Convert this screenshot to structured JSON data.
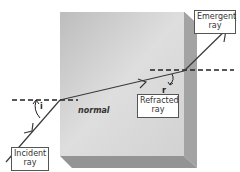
{
  "diagram": {
    "labels": {
      "incident": [
        "Incident",
        "ray"
      ],
      "refracted": [
        "Refracted",
        "ray"
      ],
      "emergent": [
        "Emergent",
        "ray"
      ],
      "normal": "normal",
      "angle_incidence": "i",
      "angle_refraction": "r"
    },
    "colors": {
      "block_front_light": "#e2e2e2",
      "block_front_dark": "#b9b9b9",
      "block_side": "#9a9a9a",
      "block_bottom": "#8e8e8e",
      "ray": "#3a3a3a",
      "normal_line": "#222222",
      "label_border": "#555555"
    }
  }
}
